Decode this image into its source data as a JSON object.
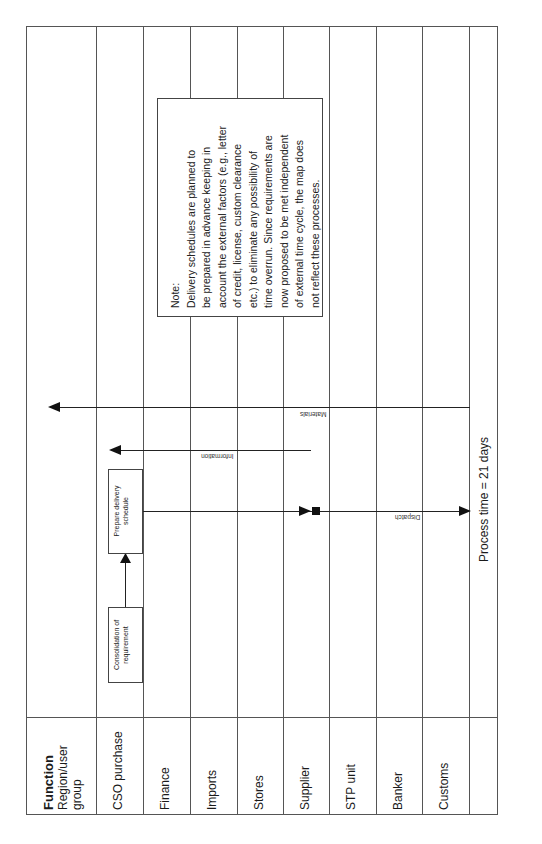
{
  "header": {
    "function_label": "Function",
    "region_label": "Region/user",
    "group_label": "group"
  },
  "lanes": [
    {
      "label": "CSO purchase"
    },
    {
      "label": "Finance"
    },
    {
      "label": "Imports"
    },
    {
      "label": "Stores"
    },
    {
      "label": "Supplier"
    },
    {
      "label": "STP unit"
    },
    {
      "label": "Banker"
    },
    {
      "label": "Customs"
    },
    {
      "label": ""
    }
  ],
  "process_boxes": {
    "consolidation": {
      "line1": "Consolidation of",
      "line2": "requirement"
    },
    "prepare": {
      "line1": "Prepare delivery",
      "line2": "schedule"
    }
  },
  "flows": {
    "materials": "Materials",
    "information": "Information",
    "dispatch": "Dispatch"
  },
  "note": {
    "title": "Note:",
    "lines": [
      "Delivery schedules are planned to",
      "be prepared in advance keeping in",
      "account the external factors (e.g., letter",
      "of credit, license, custom clearance",
      "etc.) to eliminate any possibility of",
      "time overrun. Since requirements are",
      "now proposed to be met independent",
      "of external time cycle, the map does",
      "not reflect these processes."
    ]
  },
  "process_time": "Process time = 21 days"
}
